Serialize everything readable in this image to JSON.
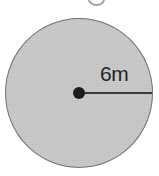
{
  "figure": {
    "title": "",
    "shape": "circle",
    "background_color": "#ffffff",
    "fill_color": "#c8c8c8",
    "outline_color": "#6e6e6e",
    "marker_color": "#1c1c1c",
    "line_color": "#3a3a3a",
    "radius_label": "6m",
    "measurement": {
      "value": "6",
      "unit": "m",
      "type": "radius"
    }
  },
  "chart_data": {
    "type": "diagram",
    "title": "",
    "shape": "circle",
    "labels": [
      "6m"
    ],
    "annotations": [
      {
        "text": "6m",
        "describes": "radius",
        "value": 6,
        "unit": "m"
      }
    ],
    "elements": [
      "filled-circle",
      "center-point",
      "radius-segment",
      "radius-label"
    ]
  }
}
